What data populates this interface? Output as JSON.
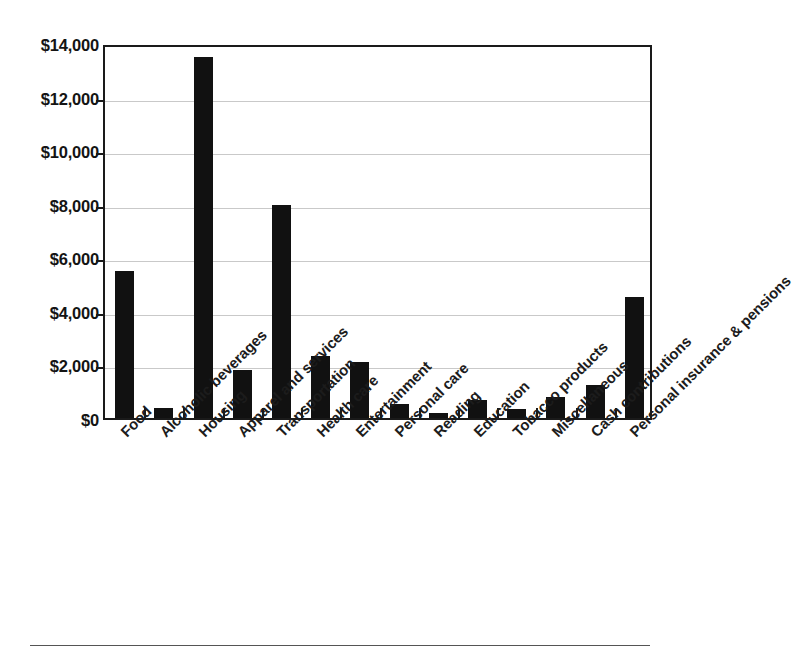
{
  "chart_data": {
    "type": "bar",
    "title": "",
    "subtitle": "",
    "xlabel": "",
    "ylabel": "",
    "ylim": [
      0,
      14000
    ],
    "ytick_step": 2000,
    "grid": true,
    "legend": false,
    "legend_position": "none",
    "bar_color": "#111111",
    "axis_color": "#1a1a1a",
    "gridline_color": "#c9c9c9",
    "y_tick_labels": [
      "$0",
      "$2,000",
      "$4,000",
      "$6,000",
      "$8,000",
      "$10,000",
      "$12,000",
      "$14,000"
    ],
    "y_tick_values": [
      0,
      2000,
      4000,
      6000,
      8000,
      10000,
      12000,
      14000
    ],
    "categories": [
      "Food",
      "Alcoholic beverages",
      "Housing",
      "Apparel and services",
      "Transportation",
      "Health care",
      "Entertainment",
      "Personal care",
      "Reading",
      "Education",
      "Tobacco products",
      "Miscellaneous",
      "Cash contributions",
      "Personal insurance & pensions"
    ],
    "values": [
      5500,
      390,
      13460,
      1790,
      7950,
      2320,
      2090,
      525,
      190,
      680,
      330,
      790,
      1240,
      4500
    ]
  }
}
